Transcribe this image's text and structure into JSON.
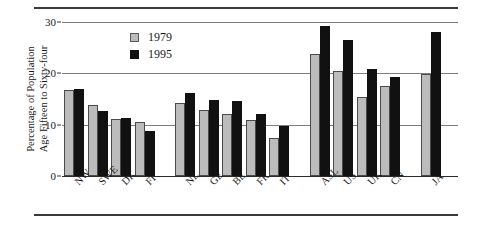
{
  "chart_data": {
    "type": "bar",
    "title": "",
    "subtitle": "",
    "xlabel": "",
    "ylabel_lines": [
      "Percentage of Population",
      "Age Fifteen to Sixty-four"
    ],
    "ylabel": "Percentage of Population Age Fifteen to Sixty-four",
    "ylim": [
      0,
      30
    ],
    "yticks": [
      0,
      10,
      20,
      30
    ],
    "ytick_labels": [
      "0",
      "10",
      "20",
      "30"
    ],
    "grid": "horizontal",
    "legend_position": "top-center-left",
    "categories": [
      "NW",
      "SWE",
      "DK",
      "FI",
      "NL",
      "GE",
      "BE",
      "FR",
      "IT",
      "ASL",
      "US",
      "UK",
      "CN",
      "JA"
    ],
    "groups": [
      {
        "name": "group-1",
        "categories": [
          "NW",
          "SWE",
          "DK",
          "FI"
        ]
      },
      {
        "name": "group-2",
        "categories": [
          "NL",
          "GE",
          "BE",
          "FR",
          "IT"
        ]
      },
      {
        "name": "group-3",
        "categories": [
          "ASL",
          "US",
          "UK",
          "CN"
        ]
      },
      {
        "name": "group-4",
        "categories": [
          "JA"
        ]
      }
    ],
    "series": [
      {
        "name": "1979",
        "color": "#bcbcbc",
        "values": [
          16.8,
          13.8,
          11.2,
          10.5,
          14.3,
          12.8,
          12.0,
          11.0,
          7.5,
          23.7,
          20.5,
          15.3,
          17.5,
          19.9
        ]
      },
      {
        "name": "1995",
        "color": "#111111",
        "values": [
          17.0,
          12.7,
          11.3,
          8.8,
          16.2,
          14.9,
          14.7,
          12.0,
          9.7,
          29.2,
          26.4,
          20.8,
          19.3,
          28.0
        ]
      }
    ]
  },
  "legend": {
    "items": [
      {
        "label": "1979",
        "color": "#bcbcbc"
      },
      {
        "label": "1995",
        "color": "#111111"
      }
    ]
  }
}
